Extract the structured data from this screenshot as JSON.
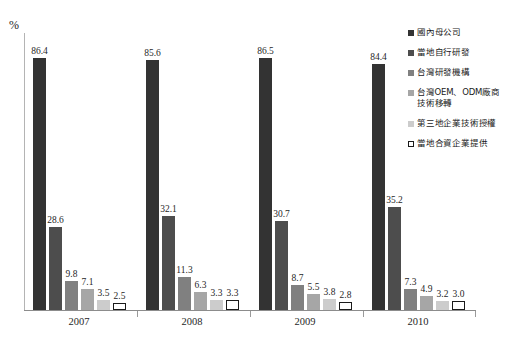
{
  "chart_data": {
    "type": "bar",
    "title": "",
    "subtitle": "",
    "xlabel": "",
    "ylabel": "%",
    "ylim": [
      0,
      95
    ],
    "grid": false,
    "legend_position": "right",
    "categories": [
      "2007",
      "2008",
      "2009",
      "2010"
    ],
    "series": [
      {
        "name": "國內母公司",
        "color": "#333333",
        "values": [
          86.4,
          85.6,
          86.5,
          84.4
        ],
        "labels": [
          "86.4",
          "85.6",
          "86.5",
          "84.4"
        ]
      },
      {
        "name": "當地自行研發",
        "color": "#4d4d4d",
        "values": [
          28.6,
          32.1,
          30.7,
          35.2
        ],
        "labels": [
          "28.6",
          "32.1",
          "30.7",
          "35.2"
        ]
      },
      {
        "name": "台灣研發機構",
        "color": "#808080",
        "values": [
          9.8,
          11.3,
          8.7,
          7.3
        ],
        "labels": [
          "9.8",
          "11.3",
          "8.7",
          "7.3"
        ]
      },
      {
        "name": "台灣OEM、ODM廠商技術移轉",
        "color": "#a6a6a6",
        "values": [
          7.1,
          6.3,
          5.5,
          4.9
        ],
        "labels": [
          "7.1",
          "6.3",
          "5.5",
          "4.9"
        ]
      },
      {
        "name": "第三地企業技術授權",
        "color": "#cccccc",
        "values": [
          3.5,
          3.3,
          3.8,
          3.2
        ],
        "labels": [
          "3.5",
          "3.3",
          "3.8",
          "3.2"
        ]
      },
      {
        "name": "當地合資企業提供",
        "color": "#ffffff",
        "border": "#1a1a1a",
        "values": [
          2.5,
          3.3,
          2.8,
          3.0
        ],
        "labels": [
          "2.5",
          "3.3",
          "2.8",
          "3.0"
        ]
      }
    ]
  },
  "axis": {
    "y_unit": "%",
    "x_tick_labels": [
      "2007",
      "2008",
      "2009",
      "2010"
    ]
  },
  "legend": {
    "items": [
      {
        "label": "國內母公司",
        "color": "#333333",
        "border": "#333333"
      },
      {
        "label": "當地自行研發",
        "color": "#4d4d4d",
        "border": "#4d4d4d"
      },
      {
        "label": "台灣研發機構",
        "color": "#808080",
        "border": "#808080"
      },
      {
        "label": "台灣OEM、ODM廠商技術移轉",
        "color": "#a6a6a6",
        "border": "#a6a6a6"
      },
      {
        "label": "第三地企業技術授權",
        "color": "#cccccc",
        "border": "#cccccc"
      },
      {
        "label": "當地合資企業提供",
        "color": "#ffffff",
        "border": "#1a1a1a"
      }
    ]
  }
}
